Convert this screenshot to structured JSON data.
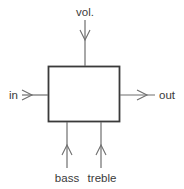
{
  "diagram": {
    "block": {
      "label": ""
    },
    "ports": {
      "vol": {
        "label": "vol.",
        "direction": "in",
        "side": "top"
      },
      "in": {
        "label": "in",
        "direction": "in",
        "side": "left"
      },
      "out": {
        "label": "out",
        "direction": "out",
        "side": "right"
      },
      "bass": {
        "label": "bass",
        "direction": "in",
        "side": "bottom"
      },
      "treble": {
        "label": "treble",
        "direction": "in",
        "side": "bottom"
      }
    },
    "colors": {
      "box_stroke": "#3a3a3a",
      "wire": "#6e6e6e",
      "text": "#3a3a3a"
    }
  }
}
